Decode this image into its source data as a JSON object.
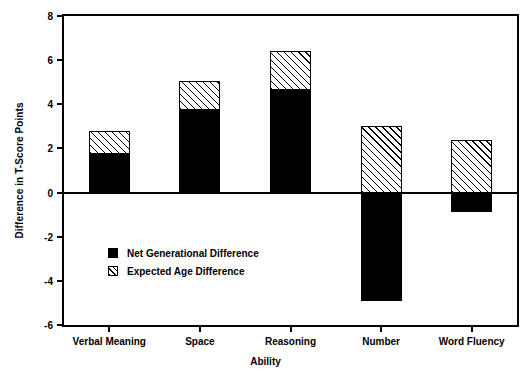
{
  "chart_data": {
    "type": "bar",
    "title": "",
    "subtitle": "",
    "xlabel": "Ability",
    "ylabel": "Difference in T-Score Points",
    "categories": [
      "Verbal Meaning",
      "Space",
      "Reasoning",
      "Number",
      "Word Fluency"
    ],
    "ylim": [
      -6,
      8
    ],
    "yticks": [
      -6,
      -4,
      -2,
      0,
      2,
      4,
      6,
      8
    ],
    "ytick_labels": [
      "-6",
      "-4",
      "-2",
      "0",
      "2",
      "4",
      "6",
      "8"
    ],
    "grid": false,
    "stacked": true,
    "legend_position": "inside-lower-left",
    "series": [
      {
        "name": "Net Generational Difference",
        "fill": "solid-black",
        "color": "#000000",
        "values": [
          1.75,
          3.75,
          4.65,
          -4.9,
          -0.9
        ]
      },
      {
        "name": "Expected Age Difference",
        "fill": "white-diagonal-hatch",
        "color": "#ffffff",
        "values": [
          1.05,
          1.3,
          1.75,
          3.0,
          2.4
        ]
      }
    ],
    "stack_tops": [
      2.8,
      5.05,
      6.4,
      3.0,
      2.4
    ]
  },
  "legend": {
    "items": [
      {
        "label": "Net Generational Difference",
        "swatch": "solid-black-square"
      },
      {
        "label": "Expected Age Difference",
        "swatch": "hatched-square"
      }
    ]
  }
}
